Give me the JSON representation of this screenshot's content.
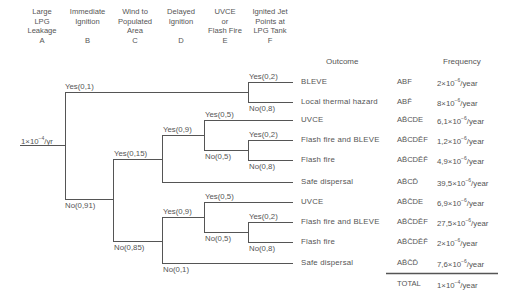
{
  "headers": [
    {
      "lines": [
        "Large",
        "LPG",
        "Leakage",
        "A"
      ]
    },
    {
      "lines": [
        "Immediate",
        "Ignition",
        "",
        "B"
      ]
    },
    {
      "lines": [
        "Wind to",
        "Populated",
        "Area",
        "C"
      ]
    },
    {
      "lines": [
        "Delayed",
        "Ignition",
        "",
        "D"
      ]
    },
    {
      "lines": [
        "UVCE",
        "or",
        "Flash Fire",
        "E"
      ]
    },
    {
      "lines": [
        "Ignited Jet",
        "Points at",
        "LPG Tank",
        "F"
      ]
    }
  ],
  "columns": {
    "outcome": "Outcome",
    "frequency": "Frequency"
  },
  "initiating_event": {
    "mantissa": "1×10",
    "exp": "−4",
    "unit": "/yr"
  },
  "branches": {
    "b_yes": "Yes(0,1)",
    "b_no": "No(0,91)",
    "c_yes": "Yes(0,15)",
    "c_no": "No(0,85)",
    "d_yes_upper": "Yes(0,9)",
    "d_no_lower": "No(0,1)",
    "d_yes_lower": "Yes(0,9)",
    "e_yes_1": "Yes(0,5)",
    "e_no_1": "No(0,5)",
    "e_yes_2": "Yes(0,5)",
    "e_no_2": "No(0,5)",
    "f_yes_1": "Yes(0,2)",
    "f_no_1": "No(0,8)",
    "f_yes_2": "Yes(0,2)",
    "f_no_2": "No(0,8)",
    "f_yes_3": "Yes(0,2)",
    "f_no_3": "No(0,8)"
  },
  "outcomes": [
    {
      "outcome": "BLEVE",
      "code": "ABF",
      "freq_mantissa": "2×10",
      "freq_exp": "−6",
      "unit": "/year"
    },
    {
      "outcome": "Local thermal hazard",
      "code": "ABF̄",
      "freq_mantissa": "8×10",
      "freq_exp": "−6",
      "unit": "/year"
    },
    {
      "outcome": "UVCE",
      "code": "AB̄CDE",
      "freq_mantissa": "6,1×10",
      "freq_exp": "−6",
      "unit": "/year"
    },
    {
      "outcome": "Flash fire and BLEVE",
      "code": "AB̄CDĒF",
      "freq_mantissa": "1,2×10",
      "freq_exp": "−6",
      "unit": "/year"
    },
    {
      "outcome": "Flash fire",
      "code": "AB̄CDĒF̄",
      "freq_mantissa": "4,9×10",
      "freq_exp": "−6",
      "unit": "/year"
    },
    {
      "outcome": "Safe dispersal",
      "code": "AB̄CD̄",
      "freq_mantissa": "39,5×10",
      "freq_exp": "−6",
      "unit": "/year"
    },
    {
      "outcome": "UVCE",
      "code": "AB̄C̄DE",
      "freq_mantissa": "6,9×10",
      "freq_exp": "−6",
      "unit": "/year"
    },
    {
      "outcome": "Flash fire and BLEVE",
      "code": "AB̄C̄DĒF",
      "freq_mantissa": "27,5×10",
      "freq_exp": "−6",
      "unit": "/year"
    },
    {
      "outcome": "Flash fire",
      "code": "AB̄C̄DĒF̄",
      "freq_mantissa": "2×10",
      "freq_exp": "−6",
      "unit": "/year"
    },
    {
      "outcome": "Safe dispersal",
      "code": "AB̄C̄D̄",
      "freq_mantissa": "7,6×10",
      "freq_exp": "−6",
      "unit": "/year"
    }
  ],
  "total": {
    "label": "TOTAL",
    "freq_mantissa": "1×10",
    "freq_exp": "−4",
    "unit": "/year"
  },
  "line_color": "#555555"
}
